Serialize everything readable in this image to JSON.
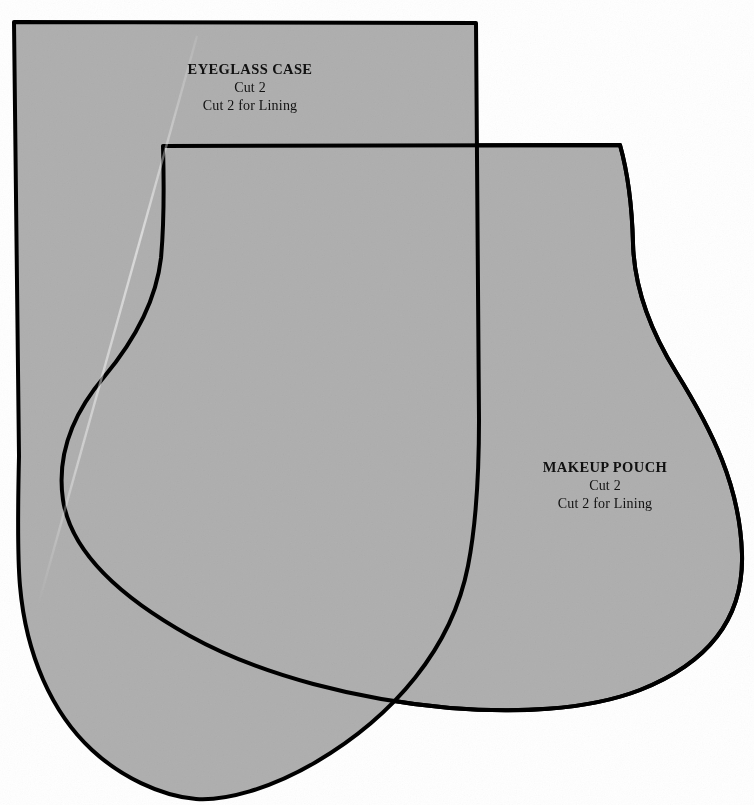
{
  "document": {
    "kind": "sewing-pattern-sheet",
    "width": 754,
    "height": 805,
    "background_color": "#ffffff",
    "piece_fill_color": "#b0b0b0",
    "outline_color": "#000000",
    "text_color": "#111111"
  },
  "pieces": [
    {
      "id": "eyeglass-case",
      "title": "EYEGLASS CASE",
      "cut_line_1": "Cut 2",
      "cut_line_2": "Cut 2 for Lining",
      "label_x": 250,
      "label_y": 70
    },
    {
      "id": "makeup-pouch",
      "title": "MAKEUP POUCH",
      "cut_line_1": "Cut 2",
      "cut_line_2": "Cut 2 for Lining",
      "label_x": 605,
      "label_y": 468
    }
  ],
  "shapes": {
    "eyeglass_case_path": "M 14,22 L 476,23 L 479,420 C 479,470 477,520 468,566 C 452,648 394,716 316,762 C 270,789 225,801 196,799 C 160,796 120,776 92,750 C 52,713 26,655 20,586 C 17,552 18,500 19,456 L 14,22 Z",
    "makeup_pouch_path": "M 163,146 L 620,145 C 627,170 632,205 633,243 C 634,286 650,330 676,372 C 712,430 740,486 742,554 C 744,620 706,664 640,690 C 586,711 512,713 450,708 C 360,700 262,676 190,636 C 120,597 71,552 63,500 C 56,452 76,410 104,377 C 134,341 156,302 161,258 C 164,225 164,182 163,146 Z",
    "scan_streak_path": "M 197,36 L 38,606"
  }
}
